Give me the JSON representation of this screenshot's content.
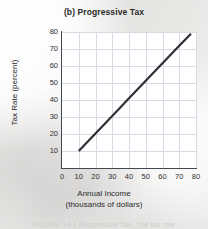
{
  "chart_data": {
    "type": "line",
    "title": "(b) Progressive Tax",
    "xlabel": "Annual Income",
    "xlabel_sub": "(thousands of dollars)",
    "ylabel": "Tax Rate (percent)",
    "xlim": [
      0,
      80
    ],
    "ylim": [
      0,
      80
    ],
    "grid": true,
    "legend": "none",
    "xticks": [
      "0",
      "10",
      "20",
      "30",
      "40",
      "50",
      "60",
      "70",
      "80"
    ],
    "xtick_values": [
      0,
      10,
      20,
      30,
      40,
      50,
      60,
      70,
      80
    ],
    "yticks": [
      "10",
      "20",
      "30",
      "40",
      "50",
      "60",
      "70",
      "80"
    ],
    "ytick_values": [
      10,
      20,
      30,
      40,
      50,
      60,
      70,
      80
    ],
    "series": [
      {
        "name": "Progressive tax rate",
        "color": "#2e3033",
        "x": [
          10,
          77
        ],
        "y": [
          10,
          79
        ],
        "points": [
          [
            10,
            10
          ],
          [
            20,
            20.3
          ],
          [
            30,
            30.6
          ],
          [
            40,
            41.0
          ],
          [
            50,
            51.3
          ],
          [
            60,
            61.6
          ],
          [
            70,
            71.9
          ],
          [
            77,
            79
          ]
        ]
      }
    ],
    "caption": "FIGURE 14.1 Progressive Tax. The tax rate"
  },
  "colors": {
    "page_background": "#eeedeb",
    "plot_background": "#ffffff",
    "gridline": "#d7dde6",
    "axis": "#44484d",
    "line": "#2e3033",
    "text": "#2b2b2b"
  }
}
